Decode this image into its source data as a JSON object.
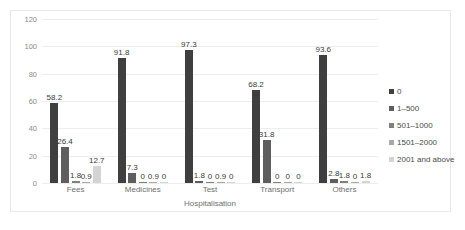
{
  "chart_data": {
    "type": "bar",
    "title": "",
    "subtitle": "",
    "xlabel": "Hospitalisation",
    "ylabel": "",
    "ylim": [
      0,
      120
    ],
    "yticks": [
      0,
      20,
      40,
      60,
      80,
      100,
      120
    ],
    "grid": true,
    "legend_position": "right",
    "categories": [
      "Fees",
      "Medicines",
      "Test",
      "Transport",
      "Others"
    ],
    "series": [
      {
        "name": "0",
        "color": "#3f3f3f",
        "values": [
          58.2,
          91.8,
          97.3,
          68.2,
          93.6
        ]
      },
      {
        "name": "1–500",
        "color": "#5e5e5e",
        "values": [
          26.4,
          7.3,
          1.8,
          31.8,
          2.8
        ]
      },
      {
        "name": "501–1000",
        "color": "#808080",
        "values": [
          1.8,
          0,
          0,
          0,
          1.8
        ]
      },
      {
        "name": "1501–2000",
        "color": "#a8a8a8",
        "values": [
          0.9,
          0.9,
          0.9,
          0,
          0
        ]
      },
      {
        "name": "2001 and above",
        "color": "#d4d4d4",
        "values": [
          12.7,
          0,
          0,
          0,
          1.8
        ]
      }
    ],
    "data_labels": [
      [
        "58.2",
        "26.4",
        "1.8",
        "0.9",
        "12.7"
      ],
      [
        "91.8",
        "7.3",
        "0",
        "0.9",
        "0"
      ],
      [
        "97.3",
        "1.8",
        "0",
        "0.9",
        "0"
      ],
      [
        "68.2",
        "31.8",
        "0",
        "0",
        "0"
      ],
      [
        "93.6",
        "2.8",
        "1.8",
        "0",
        "1.8"
      ]
    ]
  }
}
